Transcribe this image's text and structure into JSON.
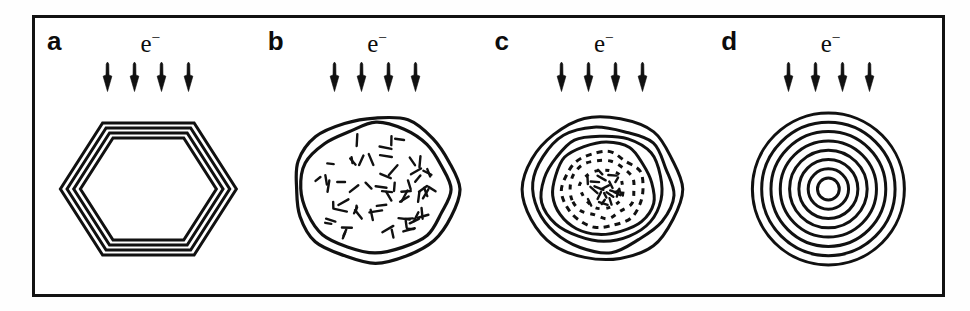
{
  "figure": {
    "kind": "scientific-diagram",
    "frame": {
      "border_color": "#121212",
      "background": "#ffffff"
    },
    "ink_color": "#111111"
  },
  "panels": [
    {
      "id": "a",
      "letter": "a",
      "beam_label": "e",
      "beam_superscript": "−",
      "arrow_count": 4,
      "arrow_direction": "down",
      "structure_name": "nested-hexagonal-shells",
      "shell_count": 4,
      "core": "hollow",
      "shape": "hexagon"
    },
    {
      "id": "b",
      "letter": "b",
      "beam_label": "e",
      "beam_superscript": "−",
      "arrow_count": 4,
      "arrow_direction": "down",
      "structure_name": "irregular-blob-with-disordered-core",
      "shell_count": 2,
      "core": "disordered-dashes",
      "shape": "irregular-round",
      "dash_count": 62
    },
    {
      "id": "c",
      "letter": "c",
      "beam_label": "e",
      "beam_superscript": "−",
      "arrow_count": 4,
      "arrow_direction": "down",
      "structure_name": "quasi-spherical-concentric-shells",
      "shell_count": 7,
      "core": "partially-disordered",
      "shape": "wavy-round",
      "dash_count": 22
    },
    {
      "id": "d",
      "letter": "d",
      "beam_label": "e",
      "beam_superscript": "−",
      "arrow_count": 4,
      "arrow_direction": "down",
      "structure_name": "carbon-onion-concentric-circles",
      "shell_count": 8,
      "core": "small-circle",
      "shape": "circle"
    }
  ]
}
